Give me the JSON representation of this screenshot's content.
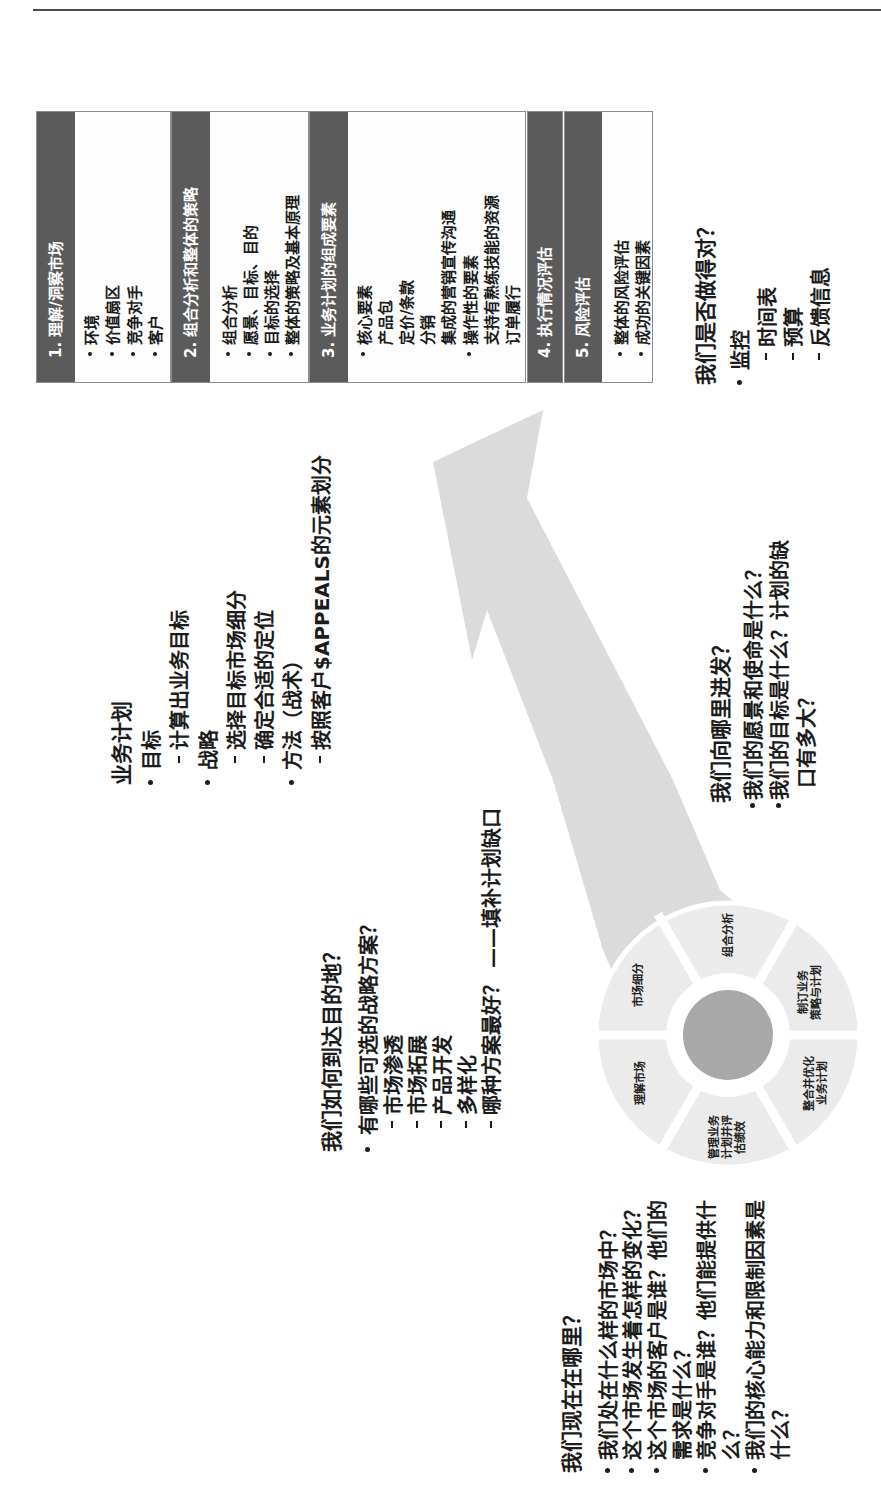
{
  "colors": {
    "text": "#1c1c1c",
    "hdr": "#5b5b5b",
    "arrow": "#dbdbdb",
    "seg": "#ebebeb",
    "hub": "#a8a8a8"
  },
  "where_now": {
    "title": "我们现在在哪里？",
    "items": [
      {
        "lines": [
          "我们处在什么样的市场中？"
        ]
      },
      {
        "lines": [
          "这个市场发生着怎样的变化？"
        ]
      },
      {
        "lines": [
          "这个市场的客户是谁？他们的",
          "需求是什么？"
        ]
      },
      {
        "lines": [
          "竞争对手是谁？他们能提供什",
          "么？"
        ]
      },
      {
        "lines": [
          "我们的核心能力和限制因素是",
          "什么？"
        ]
      }
    ]
  },
  "how_to_get_there": {
    "title": "我们如何到达目的地？",
    "items": [
      {
        "text": "有哪些可选的战略方案？",
        "subitems": [
          "市场渗透",
          "市场拓展",
          "产品开发",
          "多样化",
          "哪种方案最好？ ——填补计划缺口"
        ]
      }
    ]
  },
  "business_plan": {
    "title": "业务计划",
    "items": [
      {
        "text": "目标",
        "subitems": [
          "计算出业务目标"
        ]
      },
      {
        "text": "战略",
        "subitems": [
          "选择目标市场细分",
          "确定合适的定位"
        ]
      },
      {
        "text": "方法（战术）",
        "subitems": [
          "按照客户$APPEALS的元素划分"
        ]
      }
    ]
  },
  "where_are_we_going": {
    "title": "我们向哪里进发？",
    "items": [
      {
        "lines": [
          "我们的愿景和使命是什么？"
        ]
      },
      {
        "lines": [
          "我们的目标是什么？计划的缺",
          "口有多大？"
        ]
      }
    ]
  },
  "are_we_doing_right": {
    "title": "我们是否做得对？",
    "items": [
      {
        "text": "监控",
        "subitems": [
          "时间表",
          "预算",
          "反馈信息"
        ]
      }
    ]
  },
  "cycle_wheel": {
    "segments": [
      {
        "lines": [
          "组合分析"
        ]
      },
      {
        "lines": [
          "制订业务",
          "策略与计划"
        ]
      },
      {
        "lines": [
          "整合并优化",
          "业务计划"
        ]
      },
      {
        "lines": [
          "管理业务",
          "计划并评",
          "估绩效"
        ]
      },
      {
        "lines": [
          "理解市场"
        ]
      },
      {
        "lines": [
          "市场细分"
        ]
      }
    ]
  },
  "steps": [
    {
      "header": "1. 理解/洞察市场",
      "lines": [
        {
          "text": "环境",
          "bullet": true
        },
        {
          "text": "价值扇区",
          "bullet": true
        },
        {
          "text": "竞争对手",
          "bullet": true
        },
        {
          "text": "客户",
          "bullet": true
        }
      ]
    },
    {
      "header": "2. 组合分析和整体的策略",
      "lines": [
        {
          "text": "组合分析",
          "bullet": true
        },
        {
          "text": "愿景、目标、目的",
          "bullet": true
        },
        {
          "text": "目标的选择",
          "bullet": true
        },
        {
          "text": "整体的策略及基本原理",
          "bullet": true
        }
      ]
    },
    {
      "header": "3. 业务计划的组成要素",
      "lines": [
        {
          "text": "核心要素",
          "bullet": true
        },
        {
          "text": "产品包",
          "bullet": false
        },
        {
          "text": "定价/条款",
          "bullet": false
        },
        {
          "text": "分销",
          "bullet": false
        },
        {
          "text": "集成的营销宣传沟通",
          "bullet": false
        },
        {
          "text": "操作性的要素",
          "bullet": true
        },
        {
          "text": "支持有熟练技能的资源",
          "bullet": false
        },
        {
          "text": "订单履行",
          "bullet": false
        }
      ]
    },
    {
      "header": "4. 执行情况评估",
      "lines": []
    },
    {
      "header": "5. 风险评估",
      "lines": [
        {
          "text": "整体的风险评估",
          "bullet": true
        },
        {
          "text": "成功的关键因素",
          "bullet": true
        }
      ]
    }
  ]
}
